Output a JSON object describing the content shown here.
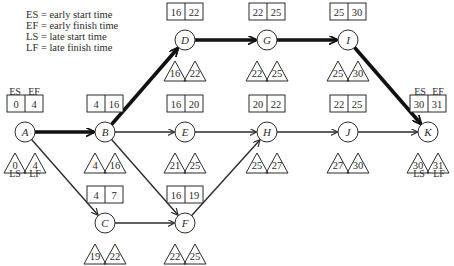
{
  "legend": [
    "ES = early start time",
    "EF = early finish time",
    "LS = late start time",
    "LF = late finish time"
  ],
  "captions": {
    "es": "ES",
    "ef": "EF",
    "ls": "LS",
    "lf": "LF"
  },
  "colors": {
    "line": "#2b2b2b",
    "background": "#ffffff"
  },
  "nodes": [
    {
      "id": "A",
      "label": "A",
      "x": 25,
      "y": 132,
      "es": "0",
      "ef": "4",
      "ls": "0",
      "lf": "4",
      "box": "above"
    },
    {
      "id": "B",
      "label": "B",
      "x": 105,
      "y": 132,
      "es": "4",
      "ef": "16",
      "ls": "4",
      "lf": "16",
      "box": "above"
    },
    {
      "id": "C",
      "label": "C",
      "x": 105,
      "y": 223,
      "es": "4",
      "ef": "7",
      "ls": "19",
      "lf": "22",
      "box": "above"
    },
    {
      "id": "D",
      "label": "D",
      "x": 185,
      "y": 40,
      "es": "16",
      "ef": "22",
      "ls": "16",
      "lf": "22",
      "box": "above"
    },
    {
      "id": "E",
      "label": "E",
      "x": 185,
      "y": 132,
      "es": "16",
      "ef": "20",
      "ls": "21",
      "lf": "25",
      "box": "above"
    },
    {
      "id": "F",
      "label": "F",
      "x": 185,
      "y": 223,
      "es": "16",
      "ef": "19",
      "ls": "22",
      "lf": "25",
      "box": "above"
    },
    {
      "id": "G",
      "label": "G",
      "x": 267,
      "y": 40,
      "es": "22",
      "ef": "25",
      "ls": "22",
      "lf": "25",
      "box": "above"
    },
    {
      "id": "H",
      "label": "H",
      "x": 267,
      "y": 132,
      "es": "20",
      "ef": "22",
      "ls": "25",
      "lf": "27",
      "box": "above"
    },
    {
      "id": "I",
      "label": "I",
      "x": 348,
      "y": 40,
      "es": "25",
      "ef": "30",
      "ls": "25",
      "lf": "30",
      "box": "above"
    },
    {
      "id": "J",
      "label": "J",
      "x": 348,
      "y": 132,
      "es": "22",
      "ef": "25",
      "ls": "27",
      "lf": "30",
      "box": "above"
    },
    {
      "id": "K",
      "label": "K",
      "x": 428,
      "y": 132,
      "es": "30",
      "ef": "31",
      "ls": "30",
      "lf": "31",
      "box": "above"
    }
  ],
  "edges": [
    {
      "from": "A",
      "to": "B",
      "critical": true
    },
    {
      "from": "A",
      "to": "C",
      "critical": false
    },
    {
      "from": "B",
      "to": "D",
      "critical": true
    },
    {
      "from": "B",
      "to": "E",
      "critical": false
    },
    {
      "from": "B",
      "to": "F",
      "critical": false
    },
    {
      "from": "C",
      "to": "F",
      "critical": false
    },
    {
      "from": "D",
      "to": "G",
      "critical": true
    },
    {
      "from": "E",
      "to": "H",
      "critical": false
    },
    {
      "from": "F",
      "to": "H",
      "critical": false
    },
    {
      "from": "G",
      "to": "I",
      "critical": true
    },
    {
      "from": "H",
      "to": "J",
      "critical": false
    },
    {
      "from": "I",
      "to": "K",
      "critical": true
    },
    {
      "from": "J",
      "to": "K",
      "critical": false
    }
  ]
}
